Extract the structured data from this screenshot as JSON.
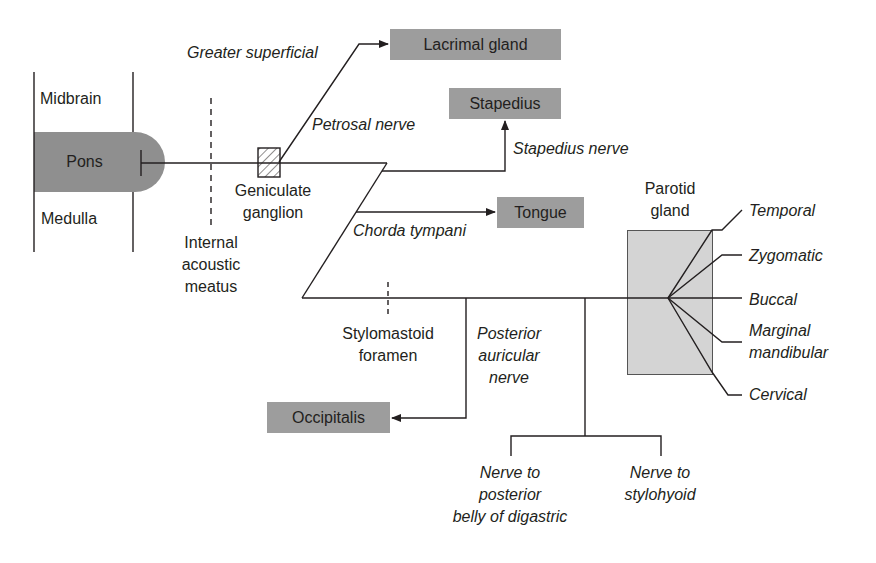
{
  "brainstem": {
    "midbrain": "Midbrain",
    "pons": "Pons",
    "medulla": "Medulla"
  },
  "landmarks": {
    "internal_acoustic_meatus": [
      "Internal",
      "acoustic",
      "meatus"
    ],
    "geniculate_ganglion": [
      "Geniculate",
      "ganglion"
    ],
    "stylomastoid_foramen": [
      "Stylomastoid",
      "foramen"
    ],
    "parotid_gland": [
      "Parotid",
      "gland"
    ]
  },
  "nerves": {
    "greater_superficial": "Greater superficial",
    "petrosal_nerve": "Petrosal nerve",
    "stapedius_nerve": "Stapedius nerve",
    "chorda_tympani": "Chorda tympani",
    "posterior_auricular": [
      "Posterior",
      "auricular",
      "nerve"
    ],
    "nerve_digastric": [
      "Nerve to",
      "posterior",
      "belly of digastric"
    ],
    "nerve_stylohyoid": [
      "Nerve to",
      "stylohyoid"
    ]
  },
  "targets": {
    "lacrimal_gland": "Lacrimal gland",
    "stapedius": "Stapedius",
    "tongue": "Tongue",
    "occipitalis": "Occipitalis"
  },
  "terminal_branches": {
    "temporal": "Temporal",
    "zygomatic": "Zygomatic",
    "buccal": "Buccal",
    "marginal": [
      "Marginal",
      "mandibular"
    ],
    "cervical": "Cervical"
  },
  "colors": {
    "target_box": "#9d9d9d",
    "pons": "#8f8f8f",
    "parotid": "#d4d4d4",
    "line": "#231f20"
  }
}
